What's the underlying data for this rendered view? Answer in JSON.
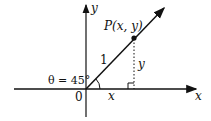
{
  "diagram": {
    "title": "",
    "axes": {
      "x_label": "x",
      "y_label": "y"
    },
    "origin_label": "0",
    "point_label": "P(x, y)",
    "hypotenuse_label": "1",
    "angle_label": "θ = 45°",
    "leg_x_label": "x",
    "leg_y_label": "y",
    "colors": {
      "ink": "#111111",
      "background": "#ffffff"
    }
  }
}
